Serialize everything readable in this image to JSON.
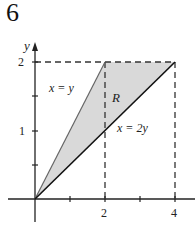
{
  "problem_number": "6",
  "diagram": {
    "type": "region-graph",
    "axes": {
      "x_label": "x",
      "y_label": "y",
      "x_ticks": [
        "2",
        "4"
      ],
      "y_ticks": [
        "1",
        "2"
      ]
    },
    "curves": [
      {
        "label": "x = y",
        "from": [
          0,
          0
        ],
        "to": [
          2,
          2
        ]
      },
      {
        "label": "x = 2y",
        "from": [
          0,
          0
        ],
        "to": [
          4,
          2
        ]
      }
    ],
    "region_label": "R",
    "region_vertices": [
      [
        0,
        0
      ],
      [
        2,
        2
      ],
      [
        4,
        2
      ]
    ],
    "dashed_guides": [
      "y = 2 from x=0 to x=4",
      "x = 2 from y=0 to y=2",
      "x = 4 from y=0 to y=2"
    ],
    "colors": {
      "fill": "#d9d9d9",
      "line": "#111111",
      "dash": "#333333"
    }
  }
}
